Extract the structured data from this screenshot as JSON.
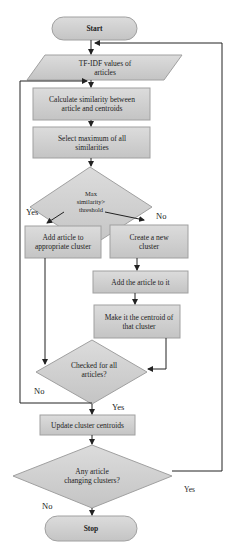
{
  "diagram": {
    "type": "flowchart",
    "colors": {
      "fill": "#d2d2d2",
      "stroke": "#9a9a9a",
      "line": "#222222"
    },
    "nodes": {
      "start": {
        "label": "Start"
      },
      "tfidf": {
        "label": "TF-IDF values of articles"
      },
      "calculate": {
        "label": "Calculate similarity between article and centroids"
      },
      "select_max": {
        "label": "Select maximum of all similarities"
      },
      "decision_threshold": {
        "label": "Max similarity> threshold"
      },
      "add_article": {
        "label": "Add article to appropriate cluster"
      },
      "create_cluster": {
        "label": "Create a new cluster"
      },
      "add_to_it": {
        "label": "Add the article to it"
      },
      "make_centroid": {
        "label": "Make it the centroid of that cluster"
      },
      "decision_checked": {
        "label": "Checked for all articles?"
      },
      "update": {
        "label": "Update cluster centroids"
      },
      "decision_changing": {
        "label": "Any article changing clusters?"
      },
      "stop": {
        "label": "Stop"
      }
    },
    "edge_labels": {
      "threshold_yes": "Yes",
      "threshold_no": "No",
      "checked_no": "No",
      "checked_yes": "Yes",
      "changing_yes": "Yes",
      "changing_no": "No"
    }
  }
}
